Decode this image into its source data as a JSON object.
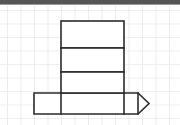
{
  "page": {
    "background_color": "#ffffff"
  },
  "top_bar": {
    "name": "window-title-bar",
    "color": "#555558",
    "height_px": 5
  },
  "grid": {
    "name": "graph-paper-grid",
    "line_color": "#e9e9ea",
    "cell_size_px": 13.5,
    "origin_x_px": 7,
    "origin_y_px": 10,
    "columns": 13,
    "rows": 8
  },
  "figure": {
    "name": "tower-outline-figure",
    "stroke_color": "#2b2b2e",
    "fill_color": "#ffffff",
    "stroke_width_px": 1.6,
    "parts": [
      {
        "label": "top-block",
        "x": 61,
        "y": 21,
        "width": 63,
        "height": 27
      },
      {
        "label": "middle-block",
        "x": 61,
        "y": 48,
        "width": 63,
        "height": 24
      },
      {
        "label": "lower-block",
        "x": 61,
        "y": 72,
        "width": 63,
        "height": 21
      },
      {
        "label": "base-bar",
        "x": 34,
        "y": 93,
        "width": 104,
        "height": 21
      },
      {
        "label": "pointed-cap",
        "x": 138,
        "y": 93,
        "width": 11,
        "height": 21
      }
    ],
    "interior_lines": [
      {
        "label": "divider-1",
        "x1": 61,
        "y1": 48,
        "x2": 124,
        "y2": 48
      },
      {
        "label": "divider-2",
        "x1": 61,
        "y1": 72,
        "x2": 124,
        "y2": 72
      },
      {
        "label": "tower-left-edge-through-base",
        "x1": 61,
        "y1": 93,
        "x2": 61,
        "y2": 114
      },
      {
        "label": "tower-right-edge-through-base",
        "x1": 124,
        "y1": 93,
        "x2": 124,
        "y2": 114
      }
    ]
  }
}
